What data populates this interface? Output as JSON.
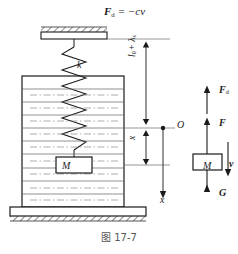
{
  "figure": {
    "caption": "图 17-7",
    "caption_number": "17-7",
    "top_force_expression": "F d = −cv",
    "top_force_symbol": "F",
    "top_force_subscript": "d",
    "top_force_rhs": "= −cv",
    "spring_constant_label": "k",
    "total_length_label": "l 0 + λ s",
    "total_length_main": "l",
    "total_length_sub1": "0",
    "total_length_plus": "+ λ",
    "total_length_sub2": "s",
    "displacement_label": "x",
    "origin_label": "O",
    "axis_label": "x",
    "mass_label": "M"
  },
  "free_body_diagram": {
    "damping_force": "F",
    "damping_force_sub": "d",
    "spring_force": "F",
    "mass_label": "M",
    "weight": "G",
    "velocity": "v"
  },
  "colors": {
    "stroke": "#1a1a1a",
    "light_stroke": "#6b6b6b",
    "hatch": "#2b2b2b",
    "background": "#ffffff",
    "caption": "#555555"
  }
}
